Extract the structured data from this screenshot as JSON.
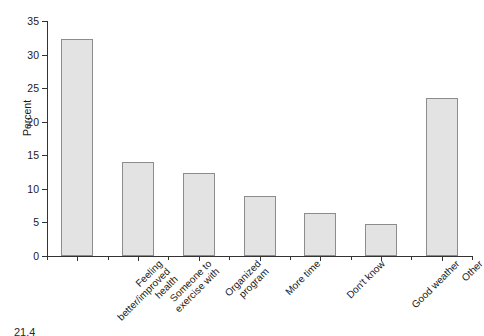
{
  "chart_data": {
    "type": "bar",
    "title": "",
    "xlabel": "",
    "ylabel": "Percent",
    "ylim": [
      0,
      35
    ],
    "yticks": [
      0,
      5,
      10,
      15,
      20,
      25,
      30,
      35
    ],
    "grid": false,
    "legend": "none",
    "categories": [
      "Feeling better/improved health",
      "Someone to exercise with",
      "Organized program",
      "More time",
      "Don't know",
      "Good weather",
      "Other"
    ],
    "category_lines": [
      [
        "Feeling",
        "better/improved",
        "health"
      ],
      [
        "Someone to",
        "exercise with"
      ],
      [
        "Organized",
        "program"
      ],
      [
        "More time"
      ],
      [
        "Don't know"
      ],
      [
        "Good weather"
      ],
      [
        "Other"
      ]
    ],
    "values": [
      32.3,
      14.0,
      12.4,
      9.0,
      6.4,
      4.7,
      23.6
    ],
    "bar_fill": "#e3e3e3",
    "bar_stroke": "#8c8c8c",
    "axis_color": "#333333"
  },
  "caption": {
    "text": "21.4"
  }
}
